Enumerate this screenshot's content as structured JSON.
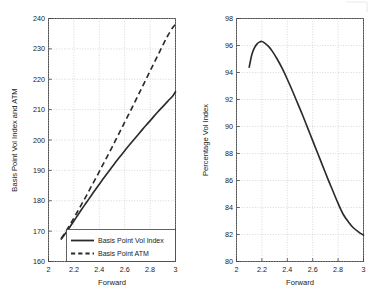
{
  "figure": {
    "width": 383,
    "height": 307,
    "background": "#ffffff",
    "line_color": "#2b2b2b",
    "axis_color": "#3c3c3c",
    "grid_color": "#b9b9b9"
  },
  "chart_data": [
    {
      "id": "left",
      "type": "line",
      "title": "",
      "xlabel": "Forward",
      "ylabel": "Basis Point Vol Index and ATM",
      "xlim": [
        2,
        3
      ],
      "ylim": [
        160,
        240
      ],
      "xticks": [
        "2",
        "2.2",
        "2.4",
        "2.6",
        "2.8",
        "3"
      ],
      "xtick_values": [
        2,
        2.2,
        2.4,
        2.6,
        2.8,
        3
      ],
      "yticks": [
        "160",
        "170",
        "180",
        "190",
        "200",
        "210",
        "220",
        "230",
        "240"
      ],
      "ytick_values": [
        160,
        170,
        180,
        190,
        200,
        210,
        220,
        230,
        240
      ],
      "grid": true,
      "legend_position": "lower right",
      "series": [
        {
          "name": "Basis Point Vol Index",
          "style": "solid",
          "x": [
            2.1,
            2.14,
            2.18,
            2.22,
            2.26,
            2.3,
            2.34,
            2.38,
            2.42,
            2.46,
            2.5,
            2.54,
            2.58,
            2.62,
            2.66,
            2.7,
            2.74,
            2.78,
            2.82,
            2.86,
            2.9,
            2.94,
            2.98,
            3.0
          ],
          "values": [
            167.4,
            169.6,
            172.1,
            174.6,
            177.1,
            179.5,
            181.9,
            184.3,
            186.6,
            188.9,
            191.1,
            193.3,
            195.4,
            197.5,
            199.5,
            201.5,
            203.5,
            205.4,
            207.3,
            209.2,
            211.0,
            212.8,
            214.6,
            215.9
          ]
        },
        {
          "name": "Basis Point ATM",
          "style": "dashed",
          "x": [
            2.1,
            2.14,
            2.18,
            2.22,
            2.26,
            2.3,
            2.34,
            2.38,
            2.42,
            2.46,
            2.5,
            2.54,
            2.58,
            2.62,
            2.66,
            2.7,
            2.74,
            2.78,
            2.82,
            2.86,
            2.9,
            2.94,
            2.98,
            3.0
          ],
          "values": [
            167.6,
            170.1,
            172.9,
            175.8,
            178.8,
            181.8,
            184.9,
            188.0,
            191.2,
            194.4,
            197.6,
            200.9,
            204.2,
            207.5,
            210.8,
            214.2,
            217.6,
            221.0,
            224.4,
            227.8,
            231.2,
            234.4,
            237.1,
            238.0
          ]
        }
      ]
    },
    {
      "id": "right",
      "type": "line",
      "title": "",
      "xlabel": "Forward",
      "ylabel": "Percentage Vol Index",
      "xlim": [
        2,
        3
      ],
      "ylim": [
        80,
        98
      ],
      "xticks": [
        "2",
        "2.2",
        "2.4",
        "2.6",
        "2.8",
        "3"
      ],
      "xtick_values": [
        2,
        2.2,
        2.4,
        2.6,
        2.8,
        3
      ],
      "yticks": [
        "80",
        "82",
        "84",
        "86",
        "88",
        "90",
        "92",
        "94",
        "96",
        "98"
      ],
      "ytick_values": [
        80,
        82,
        84,
        86,
        88,
        90,
        92,
        94,
        96,
        98
      ],
      "grid": true,
      "legend_position": "none",
      "series": [
        {
          "name": "Percentage Vol Index",
          "style": "solid",
          "x": [
            2.1,
            2.12,
            2.14,
            2.16,
            2.18,
            2.2,
            2.22,
            2.25,
            2.28,
            2.32,
            2.36,
            2.4,
            2.44,
            2.48,
            2.52,
            2.56,
            2.6,
            2.64,
            2.68,
            2.72,
            2.76,
            2.8,
            2.84,
            2.88,
            2.92,
            2.96,
            3.0
          ],
          "values": [
            94.4,
            95.3,
            95.8,
            96.1,
            96.25,
            96.3,
            96.2,
            95.95,
            95.6,
            95.0,
            94.3,
            93.5,
            92.65,
            91.75,
            90.85,
            89.9,
            88.95,
            88.0,
            87.05,
            86.1,
            85.2,
            84.3,
            83.5,
            82.95,
            82.5,
            82.2,
            81.95
          ]
        }
      ]
    }
  ]
}
